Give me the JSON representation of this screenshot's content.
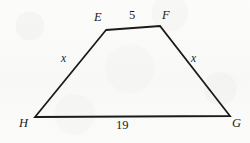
{
  "figure": {
    "type": "geometry-diagram",
    "shape": "trapezoid",
    "stroke_color": "#1a1a1a",
    "background_color": "#fbfbfa",
    "vertices": [
      {
        "name": "E",
        "label": "E",
        "x": 106,
        "y": 30
      },
      {
        "name": "F",
        "label": "F",
        "x": 160,
        "y": 26
      },
      {
        "name": "G",
        "label": "G",
        "x": 230,
        "y": 116
      },
      {
        "name": "H",
        "label": "H",
        "x": 35,
        "y": 117
      }
    ],
    "edges": [
      {
        "name": "EF",
        "from": "E",
        "to": "F",
        "measure": "5"
      },
      {
        "name": "FG",
        "from": "F",
        "to": "G",
        "measure": "x"
      },
      {
        "name": "GH",
        "from": "G",
        "to": "H",
        "measure": "19"
      },
      {
        "name": "HE",
        "from": "H",
        "to": "E",
        "measure": "x"
      }
    ],
    "labels": {
      "vertex_E": "E",
      "vertex_F": "F",
      "vertex_G": "G",
      "vertex_H": "H",
      "top_side": "5",
      "bottom_side": "19",
      "left_side": "x",
      "right_side": "x"
    }
  }
}
